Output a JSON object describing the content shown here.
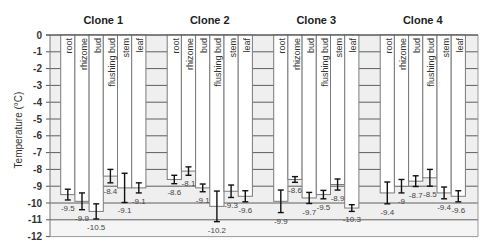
{
  "chart_data": {
    "type": "bar",
    "title": "",
    "group_labels": [
      "Clone 1",
      "Clone 2",
      "Clone 3",
      "Clone 4"
    ],
    "categories": [
      "root",
      "rhizome",
      "bud",
      "flushing bud",
      "stem",
      "leaf"
    ],
    "series": [
      {
        "name": "Clone 1",
        "values": [
          -9.5,
          -9.9,
          -10.5,
          -8.4,
          -9.1,
          -9.1
        ],
        "labels": [
          "-9.5",
          "-9.9",
          "-10.5",
          "-8.4",
          "-9.1",
          "-9.1"
        ],
        "errors": [
          0.32,
          0.5,
          0.45,
          0.4,
          0.87,
          0.3
        ]
      },
      {
        "name": "Clone 2",
        "values": [
          -8.6,
          -8.1,
          -9.1,
          -10.2,
          -9.3,
          -9.6
        ],
        "labels": [
          "-8.6",
          "-8.1",
          "-9.1",
          "-10.2",
          "-9.3",
          "-9.6"
        ],
        "errors": [
          0.25,
          0.25,
          0.23,
          0.91,
          0.37,
          0.33
        ]
      },
      {
        "name": "Clone 3",
        "values": [
          -9.9,
          -8.6,
          -9.7,
          -9.5,
          -8.9,
          -10.3
        ],
        "labels": [
          "-9.9",
          "-8.6",
          "-9.7",
          "-9.5",
          "-8.9",
          "-10.3"
        ],
        "errors": [
          0.67,
          0.17,
          0.33,
          0.25,
          0.33,
          0.2
        ]
      },
      {
        "name": "Clone 4",
        "values": [
          -9.4,
          -9.0,
          -8.7,
          -8.5,
          -9.4,
          -9.6
        ],
        "labels": [
          "-9.4",
          "-9",
          "-8.7",
          "-8.5",
          "-9.4",
          "-9.6"
        ],
        "errors": [
          0.65,
          0.4,
          0.32,
          0.5,
          0.35,
          0.33
        ]
      }
    ],
    "xlabel": "",
    "ylabel": "Temperature (°C)",
    "ylim": [
      -12,
      0
    ],
    "yticks": [
      0,
      -1,
      -2,
      -3,
      -4,
      -5,
      -6,
      -7,
      -8,
      -9,
      -10,
      -11,
      -12
    ],
    "ytick_labels": [
      "0",
      "-1",
      "-2",
      "-3",
      "-4",
      "-5",
      "-6",
      "-7",
      "-8",
      "-9",
      "-10",
      "-11",
      "-12"
    ],
    "grid": true,
    "legend": "none",
    "colors": {
      "bar_fill": "#ffffff",
      "bar_edge": "#7a7a7a",
      "plot_background": "#efefef",
      "gridline": "#5e5e5e",
      "error_bar": "#111111"
    }
  }
}
